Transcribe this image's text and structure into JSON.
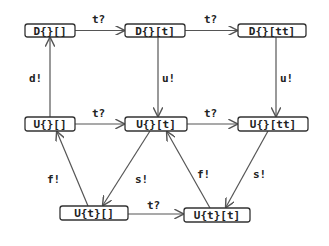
{
  "diagram": {
    "type": "state-transition-graph",
    "nodes": [
      {
        "id": "n0",
        "label": "D{}[]",
        "x": 25,
        "y": 24,
        "w": 50,
        "h": 13
      },
      {
        "id": "n1",
        "label": "D{}[t]",
        "x": 125,
        "y": 24,
        "w": 60,
        "h": 13
      },
      {
        "id": "n2",
        "label": "D{}[tt]",
        "x": 238,
        "y": 24,
        "w": 68,
        "h": 13
      },
      {
        "id": "n3",
        "label": "U{}[]",
        "x": 25,
        "y": 117,
        "w": 50,
        "h": 14
      },
      {
        "id": "n4",
        "label": "U{}[t]",
        "x": 125,
        "y": 117,
        "w": 62,
        "h": 14
      },
      {
        "id": "n5",
        "label": "U{}[tt]",
        "x": 238,
        "y": 117,
        "w": 70,
        "h": 14
      },
      {
        "id": "n6",
        "label": "U{t}[]",
        "x": 60,
        "y": 206,
        "w": 68,
        "h": 14
      },
      {
        "id": "n7",
        "label": "U{t}[t]",
        "x": 184,
        "y": 208,
        "w": 66,
        "h": 14
      }
    ],
    "edges": [
      {
        "from": "D{}[]",
        "to": "D{}[t]",
        "label": "t?"
      },
      {
        "from": "D{}[t]",
        "to": "D{}[tt]",
        "label": "t?"
      },
      {
        "from": "U{}[]",
        "to": "D{}[]",
        "label": "d!"
      },
      {
        "from": "D{}[t]",
        "to": "U{}[t]",
        "label": "u!"
      },
      {
        "from": "D{}[tt]",
        "to": "U{}[tt]",
        "label": "u!"
      },
      {
        "from": "U{}[]",
        "to": "U{}[t]",
        "label": "t?"
      },
      {
        "from": "U{}[t]",
        "to": "U{}[tt]",
        "label": "t?"
      },
      {
        "from": "U{t}[]",
        "to": "U{}[]",
        "label": "f!"
      },
      {
        "from": "U{}[t]",
        "to": "U{t}[]",
        "label": "s!"
      },
      {
        "from": "U{t}[t]",
        "to": "U{}[t]",
        "label": "f!"
      },
      {
        "from": "U{}[tt]",
        "to": "U{t}[t]",
        "label": "s!"
      },
      {
        "from": "U{t}[]",
        "to": "U{t}[t]",
        "label": "t?"
      }
    ]
  }
}
